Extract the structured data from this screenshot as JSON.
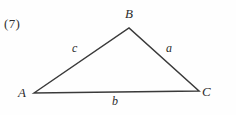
{
  "figure": {
    "index_label": "(7)",
    "background_color": "#fefefe",
    "stroke_color": "#3a3a3a",
    "text_color": "#2b2b2b",
    "vertices": [
      {
        "name": "A",
        "label": "A",
        "x": 34,
        "y": 93
      },
      {
        "name": "B",
        "label": "B",
        "x": 129,
        "y": 28
      },
      {
        "name": "C",
        "label": "C",
        "x": 199,
        "y": 91
      }
    ],
    "sides": [
      {
        "name": "a",
        "label": "a",
        "from": "B",
        "to": "C"
      },
      {
        "name": "b",
        "label": "b",
        "from": "A",
        "to": "C"
      },
      {
        "name": "c",
        "label": "c",
        "from": "A",
        "to": "B"
      }
    ],
    "labels": {
      "vertex_a": "A",
      "vertex_b": "B",
      "vertex_c": "C",
      "side_a": "a",
      "side_b": "b",
      "side_c": "c"
    }
  }
}
